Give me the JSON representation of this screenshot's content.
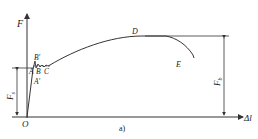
{
  "diagram": {
    "caption": "a)",
    "axes": {
      "y_label": "F",
      "x_label": "Δl",
      "origin_label": "O"
    },
    "points": {
      "A": "A",
      "A_prime": "A′",
      "B": "B",
      "B_prime": "B′",
      "C": "C",
      "D": "D",
      "E": "E"
    },
    "dimensions": {
      "yield_force": "F",
      "yield_force_sub": "s",
      "max_force": "F",
      "max_force_sub": "b"
    },
    "colors": {
      "line": "#333333",
      "text": "#222222",
      "background": "#ffffff"
    }
  }
}
